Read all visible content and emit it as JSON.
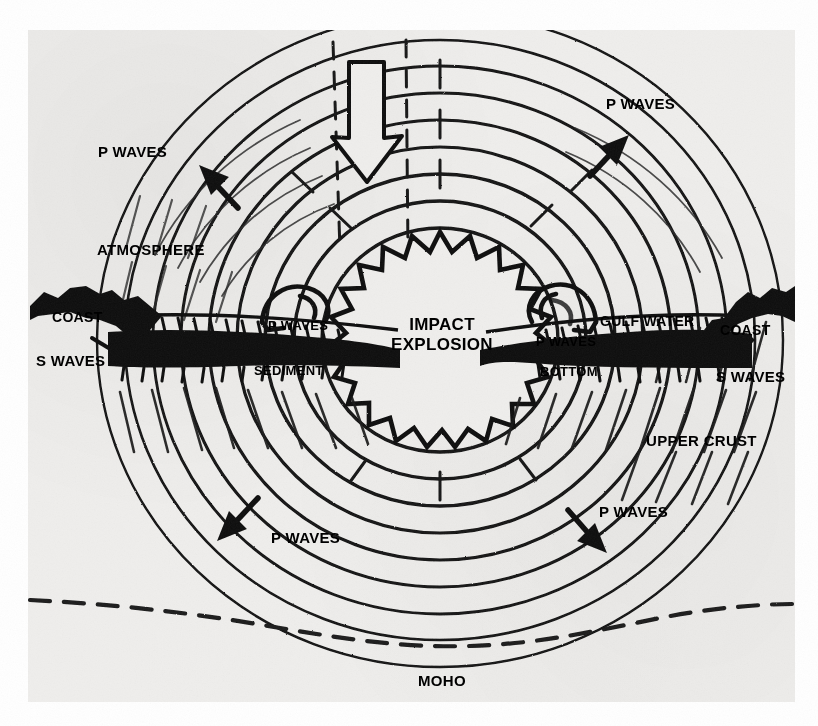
{
  "figure": {
    "medium": "scanned halftone line drawing",
    "background_color": "#efeeec",
    "ink_color": "#000000",
    "page_color": "#ffffff"
  },
  "labels": {
    "impact_explosion": "IMPACT\nEXPLOSION",
    "impact_explosion_line1": "IMPACT",
    "impact_explosion_line2": "EXPLOSION",
    "atmosphere": "ATMOSPHERE",
    "upper_crust": "UPPER CRUST",
    "moho": "MOHO",
    "gulf_water": "GULF WATER",
    "sediment": "SEDIMENT",
    "bottom": "BOTTOM",
    "coast_left": "COAST",
    "coast_right": "COAST",
    "s_waves_left": "S WAVES",
    "s_waves_right": "S WAVES",
    "p_waves_upper_left": "P WAVES",
    "p_waves_upper_right": "P WAVES",
    "p_waves_lower_left": "P WAVES",
    "p_waves_lower_right": "P WAVES",
    "p_waves_sea_left": "P WAVES",
    "p_waves_sea_right": "P WAVES"
  },
  "elements": {
    "impact_arrow": "hollow-outlined-downward-arrow",
    "explosion_burst": "zigzag-starburst",
    "wave_rings": "concentric-seismic-wavefronts",
    "moho_boundary": "dashed-curve",
    "seafloor": "hatched-dark-band",
    "tsunami_left": "curling-water-wave",
    "tsunami_right": "curling-water-wave",
    "arrow_p_upper_left": "arrow-up-left",
    "arrow_p_upper_right": "arrow-up-right",
    "arrow_p_lower_left": "arrow-down-left",
    "arrow_p_lower_right": "arrow-down-right",
    "arrow_s_right": "short-arrow-down-left"
  },
  "counts": {
    "wave_rings": 9,
    "p_wave_labels": 6,
    "s_wave_labels": 2,
    "coast_labels": 2
  }
}
